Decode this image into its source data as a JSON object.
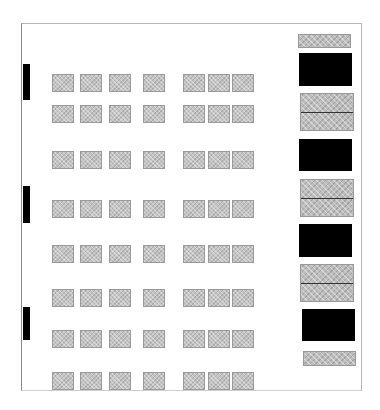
{
  "diagram": {
    "type": "floor-plan",
    "frame": {
      "left": 21,
      "top": 23,
      "width": 341,
      "height": 368
    },
    "colors": {
      "seat_fill": "#c4c4c4",
      "seat_border": "#9a9a9a",
      "solid": "#000000",
      "frame": "#b5b5b5"
    },
    "seat_size": {
      "width": 22,
      "height": 18
    },
    "seat_columns_x": [
      52,
      80,
      109,
      143,
      183,
      208,
      232
    ],
    "seat_rows_y": [
      74,
      105,
      151,
      200,
      245,
      289,
      330,
      372
    ],
    "left_wall_bars": [
      {
        "top": 64,
        "height": 36
      },
      {
        "top": 186,
        "height": 37
      },
      {
        "top": 307,
        "height": 33
      }
    ],
    "right_column": [
      {
        "kind": "hatched",
        "left": 298,
        "top": 34,
        "width": 53,
        "height": 14,
        "divider": null
      },
      {
        "kind": "black",
        "left": 299,
        "top": 53,
        "width": 53,
        "height": 33,
        "divider": null
      },
      {
        "kind": "hatched",
        "left": 300,
        "top": 93,
        "width": 54,
        "height": 38,
        "divider": 19
      },
      {
        "kind": "black",
        "left": 299,
        "top": 139,
        "width": 53,
        "height": 32,
        "divider": null
      },
      {
        "kind": "hatched",
        "left": 300,
        "top": 179,
        "width": 54,
        "height": 38,
        "divider": 19
      },
      {
        "kind": "black",
        "left": 299,
        "top": 224,
        "width": 53,
        "height": 33,
        "divider": null
      },
      {
        "kind": "hatched",
        "left": 300,
        "top": 264,
        "width": 54,
        "height": 38,
        "divider": 19
      },
      {
        "kind": "black",
        "left": 302,
        "top": 309,
        "width": 53,
        "height": 32,
        "divider": null
      },
      {
        "kind": "hatched",
        "left": 303,
        "top": 351,
        "width": 53,
        "height": 15,
        "divider": null
      }
    ]
  }
}
